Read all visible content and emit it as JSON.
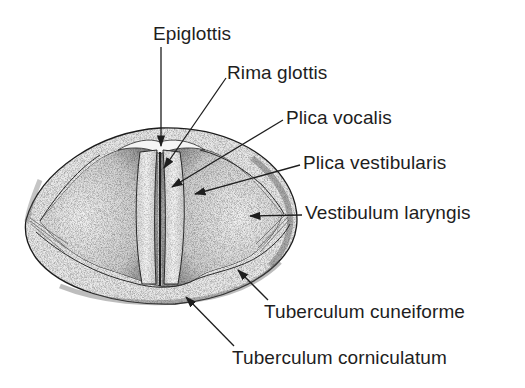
{
  "diagram": {
    "colors": {
      "line": "#1e1e1e",
      "tissue_light": "#f1f1f1",
      "tissue_mid": "#d4d4d4",
      "tissue_dark": "#9a9a9a",
      "background": "#ffffff"
    },
    "labels": [
      {
        "id": "epiglottis",
        "text": "Epiglottis",
        "x": 153,
        "y": 24
      },
      {
        "id": "rima-glottis",
        "text": "Rima glottis",
        "x": 227,
        "y": 63
      },
      {
        "id": "plica-vocalis",
        "text": "Plica vocalis",
        "x": 286,
        "y": 108
      },
      {
        "id": "plica-vestibularis",
        "text": "Plica vestibularis",
        "x": 303,
        "y": 153
      },
      {
        "id": "vestibulum-laryngis",
        "text": "Vestibulum laryngis",
        "x": 305,
        "y": 203
      },
      {
        "id": "tuberculum-cuneiforme",
        "text": "Tuberculum cuneiforme",
        "x": 264,
        "y": 302
      },
      {
        "id": "tuberculum-corniculatum",
        "text": "Tuberculum corniculatum",
        "x": 232,
        "y": 348
      }
    ]
  }
}
